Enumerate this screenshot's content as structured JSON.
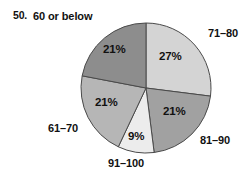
{
  "problem": {
    "number": "50."
  },
  "chart_data": {
    "type": "pie",
    "title": "",
    "subtitle": "",
    "xlabel": "",
    "ylabel": "",
    "grid": false,
    "legend_position": "outside-labels",
    "center": {
      "cx": 146,
      "cy": 88
    },
    "radius": 65,
    "start_angle_deg": 0,
    "direction": "clockwise",
    "categories": [
      "71–80",
      "81–90",
      "91–100",
      "61–70",
      "60 or below"
    ],
    "values": [
      27,
      21,
      9,
      21,
      21
    ],
    "value_labels": [
      "27%",
      "21%",
      "9%",
      "21%",
      "21%"
    ],
    "colors": [
      "#d4d4d4",
      "#a1a1a1",
      "#ececec",
      "#b6b6b6",
      "#8d8d8d"
    ],
    "slice_outline_color": "#4a4a4a",
    "slices": [
      {
        "label": "71–80",
        "value": 27,
        "value_label": "27%",
        "color": "#d4d4d4",
        "start_deg": 0,
        "end_deg": 97.2
      },
      {
        "label": "81–90",
        "value": 21,
        "value_label": "21%",
        "color": "#a1a1a1",
        "start_deg": 97.2,
        "end_deg": 172.8
      },
      {
        "label": "91–100",
        "value": 9,
        "value_label": "9%",
        "color": "#ececec",
        "start_deg": 172.8,
        "end_deg": 205.2
      },
      {
        "label": "61–70",
        "value": 21,
        "value_label": "21%",
        "color": "#b6b6b6",
        "start_deg": 205.2,
        "end_deg": 280.8
      },
      {
        "label": "60 or below",
        "value": 21,
        "value_label": "21%",
        "color": "#8d8d8d",
        "start_deg": 280.8,
        "end_deg": 360
      }
    ]
  }
}
